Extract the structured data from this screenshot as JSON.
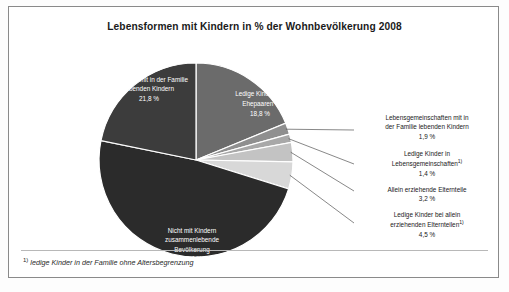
{
  "chart": {
    "title": "Lebensformen mit Kindern in % der Wohnbevölkerung 2008",
    "footnote_marker": "1)",
    "footnote_text": "ledige Kinder in der Familie ohne Altersbegrenzung"
  },
  "chart_data": {
    "type": "pie",
    "title": "Lebensformen mit Kindern in % der Wohnbevölkerung 2008",
    "unit": "%",
    "legend": "none",
    "categories": [
      "Ledige Kinder bei Ehepaaren1)",
      "Lebensgemeinschaften mit in der Familie lebenden Kindern",
      "Ledige Kinder in Lebensgemeinschaften1)",
      "Allein erziehende Elternteile",
      "Ledige Kinder bei allein erziehenden Elternteilen1)",
      "Nicht mit Kindern zusammenlebende Bevölkerung",
      "Ehepaare mit in der Familie lebenden Kindern"
    ],
    "values": [
      18.8,
      1.9,
      1.4,
      3.2,
      4.5,
      48.4,
      21.8
    ],
    "colors": [
      "#6b6b6b",
      "#8f8f8f",
      "#a8a8a8",
      "#c3c3c3",
      "#d8d8d8",
      "#2b2b2b",
      "#3c3c3c"
    ]
  },
  "slices": [
    {
      "key": "ehepaare-mit-kindern",
      "line1": "Ehepaare mit in der Familie",
      "line2": "lebenden Kindern",
      "value": "21,8 %",
      "color": "#3c3c3c"
    },
    {
      "key": "ledige-kinder-ehepaare",
      "line1": "Ledige Kinder bei",
      "line2": "Ehepaaren",
      "sup": "1)",
      "value": "18,8 %",
      "color": "#6b6b6b"
    },
    {
      "key": "lebensgemeinschaften-mit-kindern",
      "line1": "Lebensgemeinschaften mit in",
      "line2": "der Familie lebenden Kindern",
      "value": "1,9 %",
      "color": "#8f8f8f"
    },
    {
      "key": "ledige-kinder-lebensgemeinschaften",
      "line1": "Ledige Kinder in",
      "line2": "Lebensgemeinschaften",
      "sup": "1)",
      "value": "1,4 %",
      "color": "#a8a8a8"
    },
    {
      "key": "allein-erziehende-elternteile",
      "line1": "Allein erziehende Elternteile",
      "line2": "",
      "value": "3,2 %",
      "color": "#c3c3c3"
    },
    {
      "key": "ledige-kinder-allein-erziehende",
      "line1": "Ledige Kinder bei allein",
      "line2": "erziehenden Elternteilen",
      "sup": "1)",
      "value": "4,5 %",
      "color": "#d8d8d8"
    },
    {
      "key": "nicht-mit-kindern",
      "line1": "Nicht mit Kindern",
      "line2": "zusammenlebende",
      "line3": "Bevölkerung",
      "value": "48,4 %",
      "color": "#2b2b2b"
    }
  ]
}
